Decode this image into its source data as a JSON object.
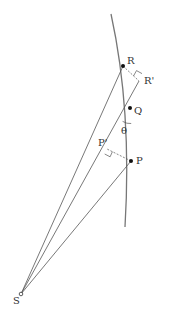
{
  "diagram": {
    "type": "geometry",
    "colors": {
      "line": "#555555",
      "dot": "#111111",
      "label": "#333333",
      "background": "#ffffff"
    },
    "points": {
      "S": {
        "label": "S",
        "x": 21,
        "y": 294
      },
      "R": {
        "label": "R",
        "x": 123,
        "y": 66
      },
      "R_prime": {
        "label": "R'",
        "x": 139,
        "y": 81
      },
      "Q": {
        "label": "Q",
        "x": 130,
        "y": 108
      },
      "P": {
        "label": "P",
        "x": 131,
        "y": 161
      },
      "P_prime": {
        "label": "P'",
        "x": 107,
        "y": 149
      }
    },
    "angle": {
      "label": "θ",
      "at": "Q"
    },
    "lines": [
      {
        "from": "S",
        "to": "R"
      },
      {
        "from": "S",
        "to": "Q",
        "extends_to": "R_prime"
      },
      {
        "from": "S",
        "to": "P"
      },
      {
        "from": "R",
        "to": "R_prime",
        "style": "dashed"
      },
      {
        "from": "P",
        "to": "P_prime",
        "style": "dashed"
      }
    ],
    "curve": {
      "name": "orbit-arc",
      "start": [
        111,
        14
      ],
      "end": [
        125,
        227
      ]
    }
  }
}
